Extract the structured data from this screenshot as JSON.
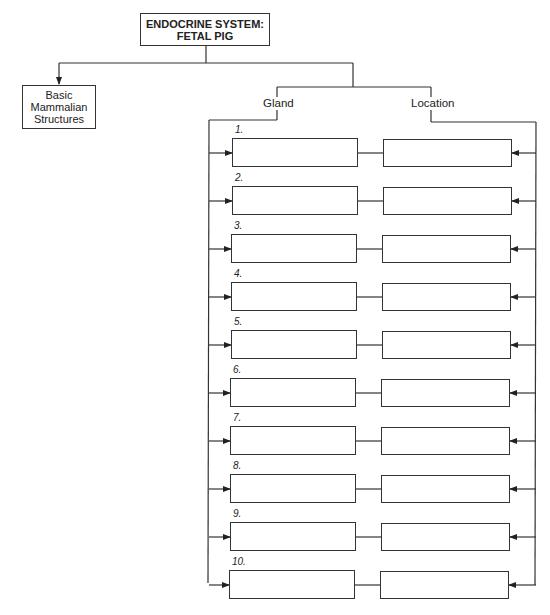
{
  "title": "ENDOCRINE SYSTEM: FETAL PIG",
  "title_lines": [
    "ENDOCRINE SYSTEM:",
    "FETAL PIG"
  ],
  "basic": {
    "lines": [
      "Basic",
      "Mammalian",
      "Structures"
    ]
  },
  "headers": {
    "gland": "Gland",
    "location": "Location"
  },
  "rows": [
    {
      "num": "1.",
      "gland": "",
      "location": ""
    },
    {
      "num": "2.",
      "gland": "",
      "location": ""
    },
    {
      "num": "3.",
      "gland": "",
      "location": ""
    },
    {
      "num": "4.",
      "gland": "",
      "location": ""
    },
    {
      "num": "5.",
      "gland": "",
      "location": ""
    },
    {
      "num": "6.",
      "gland": "",
      "location": ""
    },
    {
      "num": "7.",
      "gland": "",
      "location": ""
    },
    {
      "num": "8.",
      "gland": "",
      "location": ""
    },
    {
      "num": "9.",
      "gland": "",
      "location": ""
    },
    {
      "num": "10.",
      "gland": "",
      "location": ""
    }
  ]
}
